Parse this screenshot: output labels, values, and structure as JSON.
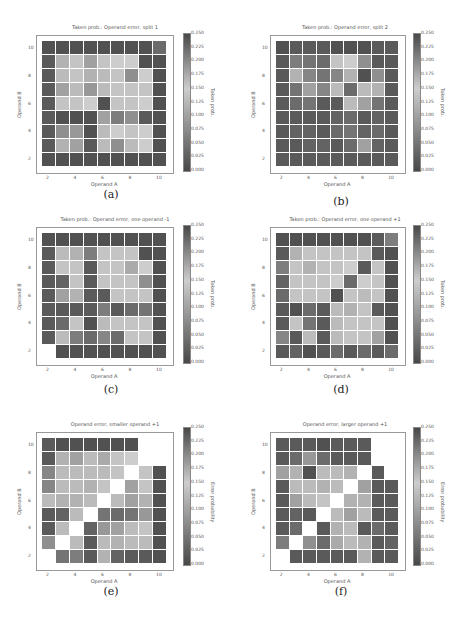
{
  "panels": [
    {
      "id": "a",
      "caption": "(a)",
      "title": "Taken prob.: Operand error, split 1",
      "cbar_label": "Taken prob."
    },
    {
      "id": "b",
      "caption": "(b)",
      "title": "Taken prob.: Operand error, split 2",
      "cbar_label": "Taken prob."
    },
    {
      "id": "c",
      "caption": "(c)",
      "title": "Taken prob.: Operand error, one operand -1",
      "cbar_label": "Taken prob."
    },
    {
      "id": "d",
      "caption": "(d)",
      "title": "Taken prob.: Operand error, one operand +1",
      "cbar_label": "Taken prob."
    },
    {
      "id": "e",
      "caption": "(e)",
      "title": "Operand error, smaller operand +1",
      "cbar_label": "Error probability"
    },
    {
      "id": "f",
      "caption": "(f)",
      "title": "Operand error, larger operand +1",
      "cbar_label": "Error probability"
    }
  ],
  "axes": {
    "xlabel": "Operand A",
    "ylabel": "Operand B",
    "xticks": [
      "2",
      "4",
      "6",
      "8",
      "10"
    ],
    "yticks": [
      "10",
      "8",
      "6",
      "4",
      "2"
    ],
    "cbar_ticks": [
      "0.250",
      "0.225",
      "0.200",
      "0.175",
      "0.150",
      "0.125",
      "0.100",
      "0.075",
      "0.050",
      "0.025",
      "0.000"
    ]
  },
  "chart_data": [
    {
      "type": "heatmap",
      "title": "Taken prob.: Operand error, split 1",
      "xlabel": "Operand A",
      "ylabel": "Operand B",
      "colorbar_label": "Taken prob.",
      "x": [
        2,
        3,
        4,
        5,
        6,
        7,
        8,
        9,
        10
      ],
      "y_top_to_bottom": [
        10,
        9,
        8,
        7,
        6,
        5,
        4,
        3,
        2
      ],
      "vmin": 0,
      "vmax": 0.25,
      "values": [
        [
          0.01,
          0.01,
          0.01,
          0.01,
          0.01,
          0.01,
          0.01,
          0.01,
          0.04
        ],
        [
          0.02,
          0.12,
          0.14,
          0.1,
          0.14,
          0.15,
          0.15,
          0.01,
          0.01
        ],
        [
          0.02,
          0.13,
          0.14,
          0.12,
          0.13,
          0.14,
          0.08,
          0.15,
          0.01
        ],
        [
          0.02,
          0.1,
          0.13,
          0.09,
          0.13,
          0.14,
          0.14,
          0.14,
          0.01
        ],
        [
          0.02,
          0.14,
          0.14,
          0.15,
          0.01,
          0.14,
          0.14,
          0.15,
          0.01
        ],
        [
          0.02,
          0.01,
          0.01,
          0.01,
          0.1,
          0.06,
          0.08,
          0.02,
          0.01
        ],
        [
          0.02,
          0.08,
          0.09,
          0.01,
          0.13,
          0.15,
          0.14,
          0.15,
          0.01
        ],
        [
          0.02,
          0.12,
          0.1,
          0.02,
          0.13,
          0.08,
          0.13,
          0.15,
          0.01
        ],
        [
          0.01,
          0.01,
          0.01,
          0.01,
          0.01,
          0.01,
          0.01,
          0.01,
          0.01
        ]
      ]
    },
    {
      "type": "heatmap",
      "title": "Taken prob.: Operand error, split 2",
      "xlabel": "Operand A",
      "ylabel": "Operand B",
      "colorbar_label": "Taken prob.",
      "x": [
        2,
        3,
        4,
        5,
        6,
        7,
        8,
        9,
        10
      ],
      "y_top_to_bottom": [
        10,
        9,
        8,
        7,
        6,
        5,
        4,
        3,
        2
      ],
      "vmin": 0,
      "vmax": 0.25,
      "values": [
        [
          0.01,
          0.02,
          0.02,
          0.02,
          0.01,
          0.01,
          0.01,
          0.02,
          0.02
        ],
        [
          0.02,
          0.06,
          0.05,
          0.04,
          0.14,
          0.15,
          0.08,
          0.02,
          0.02
        ],
        [
          0.02,
          0.12,
          0.07,
          0.05,
          0.07,
          0.12,
          0.01,
          0.08,
          0.02
        ],
        [
          0.02,
          0.05,
          0.1,
          0.07,
          0.13,
          0.04,
          0.13,
          0.12,
          0.02
        ],
        [
          0.02,
          0.04,
          0.05,
          0.02,
          0.02,
          0.13,
          0.1,
          0.05,
          0.02
        ],
        [
          0.02,
          0.02,
          0.02,
          0.02,
          0.03,
          0.04,
          0.02,
          0.03,
          0.02
        ],
        [
          0.02,
          0.03,
          0.03,
          0.02,
          0.04,
          0.05,
          0.03,
          0.04,
          0.02
        ],
        [
          0.02,
          0.02,
          0.03,
          0.03,
          0.02,
          0.04,
          0.1,
          0.03,
          0.02
        ],
        [
          0.02,
          0.02,
          0.02,
          0.02,
          0.02,
          0.02,
          0.02,
          0.02,
          0.02
        ]
      ]
    },
    {
      "type": "heatmap",
      "title": "Taken prob.: Operand error, one operand -1",
      "xlabel": "Operand A",
      "ylabel": "Operand B",
      "colorbar_label": "Taken prob.",
      "x": [
        2,
        3,
        4,
        5,
        6,
        7,
        8,
        9,
        10
      ],
      "y_top_to_bottom": [
        10,
        9,
        8,
        7,
        6,
        5,
        4,
        3,
        2
      ],
      "vmin": 0,
      "vmax": 0.25,
      "values": [
        [
          0.01,
          0.01,
          0.01,
          0.01,
          0.01,
          0.01,
          0.01,
          0.01,
          0.01
        ],
        [
          0.02,
          0.13,
          0.12,
          0.06,
          0.14,
          0.14,
          0.14,
          0.01,
          0.01
        ],
        [
          0.02,
          0.14,
          0.14,
          0.02,
          0.14,
          0.14,
          0.11,
          0.15,
          0.01
        ],
        [
          0.02,
          0.03,
          0.14,
          0.02,
          0.14,
          0.14,
          0.14,
          0.08,
          0.01
        ],
        [
          0.02,
          0.1,
          0.12,
          0.02,
          0.02,
          0.14,
          0.14,
          0.14,
          0.01
        ],
        [
          0.02,
          0.02,
          0.02,
          0.02,
          0.06,
          0.02,
          0.04,
          0.05,
          0.01
        ],
        [
          0.02,
          0.04,
          0.14,
          0.01,
          0.13,
          0.14,
          0.14,
          0.14,
          0.01
        ],
        [
          0.02,
          0.13,
          0.06,
          0.04,
          0.07,
          0.04,
          0.14,
          0.14,
          0.01
        ],
        [
          null,
          0.01,
          0.01,
          0.01,
          0.01,
          0.01,
          0.01,
          0.01,
          0.01
        ]
      ]
    },
    {
      "type": "heatmap",
      "title": "Taken prob.: Operand error, one operand +1",
      "xlabel": "Operand A",
      "ylabel": "Operand B",
      "colorbar_label": "Taken prob.",
      "x": [
        2,
        3,
        4,
        5,
        6,
        7,
        8,
        9,
        10
      ],
      "y_top_to_bottom": [
        10,
        9,
        8,
        7,
        6,
        5,
        4,
        3,
        2
      ],
      "vmin": 0,
      "vmax": 0.25,
      "values": [
        [
          0.01,
          0.01,
          0.01,
          0.01,
          0.01,
          0.01,
          0.01,
          0.02,
          0.06
        ],
        [
          0.02,
          0.12,
          0.14,
          0.14,
          0.14,
          0.14,
          0.14,
          0.02,
          0.01
        ],
        [
          0.06,
          0.14,
          0.12,
          0.14,
          0.14,
          0.15,
          0.02,
          0.14,
          0.01
        ],
        [
          0.03,
          0.14,
          0.14,
          0.14,
          0.15,
          0.04,
          0.15,
          0.14,
          0.01
        ],
        [
          0.04,
          0.14,
          0.14,
          0.14,
          0.01,
          0.14,
          0.13,
          0.14,
          0.01
        ],
        [
          0.02,
          0.01,
          0.04,
          0.02,
          0.13,
          0.12,
          0.14,
          0.02,
          0.01
        ],
        [
          0.02,
          0.14,
          0.05,
          0.02,
          0.13,
          0.14,
          0.14,
          0.14,
          0.01
        ],
        [
          0.07,
          0.02,
          0.13,
          0.02,
          0.13,
          0.14,
          0.14,
          0.1,
          0.01
        ],
        [
          0.02,
          0.03,
          0.01,
          0.02,
          0.04,
          0.02,
          0.04,
          0.02,
          0.04
        ]
      ]
    },
    {
      "type": "heatmap",
      "title": "Operand error, smaller operand +1",
      "xlabel": "Operand A",
      "ylabel": "Operand B",
      "colorbar_label": "Error probability",
      "x": [
        2,
        3,
        4,
        5,
        6,
        7,
        8,
        9,
        10
      ],
      "y_top_to_bottom": [
        10,
        9,
        8,
        7,
        6,
        5,
        4,
        3,
        2
      ],
      "vmin": 0,
      "vmax": 0.25,
      "values": [
        [
          0.02,
          0.01,
          0.01,
          0.01,
          0.01,
          0.01,
          0.01,
          null,
          null
        ],
        [
          0.02,
          0.12,
          0.1,
          0.13,
          0.11,
          0.14,
          0.15,
          null,
          null
        ],
        [
          0.07,
          0.13,
          0.13,
          0.13,
          0.13,
          0.14,
          null,
          0.14,
          0.01
        ],
        [
          0.07,
          0.13,
          0.13,
          0.12,
          0.14,
          null,
          0.1,
          0.14,
          0.01
        ],
        [
          0.13,
          0.12,
          0.12,
          0.13,
          null,
          0.13,
          0.1,
          0.12,
          0.01
        ],
        [
          0.02,
          0.03,
          0.13,
          null,
          0.05,
          0.04,
          0.05,
          0.09,
          0.01
        ],
        [
          0.02,
          0.13,
          null,
          0.03,
          0.09,
          0.1,
          0.13,
          0.14,
          0.01
        ],
        [
          0.08,
          null,
          0.13,
          0.02,
          0.13,
          0.12,
          0.13,
          0.13,
          0.01
        ],
        [
          null,
          0.05,
          0.06,
          0.02,
          0.12,
          0.03,
          0.02,
          0.02,
          0.01
        ]
      ]
    },
    {
      "type": "heatmap",
      "title": "Operand error, larger operand +1",
      "xlabel": "Operand A",
      "ylabel": "Operand B",
      "colorbar_label": "Error probability",
      "x": [
        2,
        3,
        4,
        5,
        6,
        7,
        8,
        9,
        10
      ],
      "y_top_to_bottom": [
        10,
        9,
        8,
        7,
        6,
        5,
        4,
        3,
        2
      ],
      "vmin": 0,
      "vmax": 0.25,
      "values": [
        [
          0.02,
          0.02,
          0.02,
          0.01,
          0.02,
          0.02,
          0.02,
          null,
          null
        ],
        [
          0.02,
          0.04,
          0.09,
          0.04,
          0.02,
          0.02,
          0.02,
          null,
          null
        ],
        [
          0.1,
          0.12,
          0.01,
          0.13,
          0.13,
          0.12,
          null,
          0.02,
          null
        ],
        [
          0.02,
          0.13,
          0.13,
          0.12,
          0.13,
          null,
          0.1,
          0.02,
          0.02
        ],
        [
          0.02,
          0.1,
          0.13,
          0.14,
          null,
          0.12,
          0.12,
          0.02,
          0.02
        ],
        [
          0.02,
          0.03,
          0.02,
          null,
          0.13,
          0.1,
          0.13,
          0.02,
          0.02
        ],
        [
          0.02,
          0.04,
          null,
          0.02,
          0.12,
          0.13,
          0.02,
          0.04,
          0.02
        ],
        [
          0.06,
          null,
          0.08,
          0.04,
          0.11,
          0.13,
          0.12,
          0.02,
          0.03
        ],
        [
          null,
          0.02,
          0.02,
          0.02,
          0.02,
          0.02,
          0.12,
          0.02,
          0.02
        ]
      ]
    }
  ]
}
